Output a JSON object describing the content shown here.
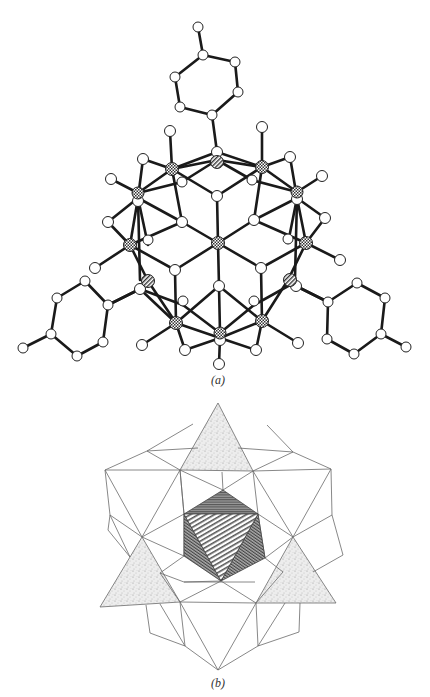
{
  "figure": {
    "panels": [
      {
        "id": "a",
        "caption": "(a)",
        "description": "Ball-and-stick model of a polyoxometalate cluster with three tolyl substituents",
        "atom_types": {
          "open": "oxygen / carbon atom (white sphere)",
          "checkered": "metal atom (cross-hatched sphere)",
          "hatched": "heteroatom (diagonally hatched sphere)"
        }
      },
      {
        "id": "b",
        "caption": "(b)",
        "description": "Polyhedral representation: central hatched octahedron, surrounding edge-sharing octahedra, three stippled tetrahedra",
        "fills": {
          "stipple": "#e6e6e6",
          "center_dark": "#7a7a7a",
          "hatch_line": "#555555"
        }
      }
    ]
  },
  "colors": {
    "bond": "#1a1a1a",
    "atom_fill": "#ffffff",
    "atom_stroke": "#222222",
    "polyhedron_edge": "#6a6a6a",
    "background": "#ffffff"
  }
}
